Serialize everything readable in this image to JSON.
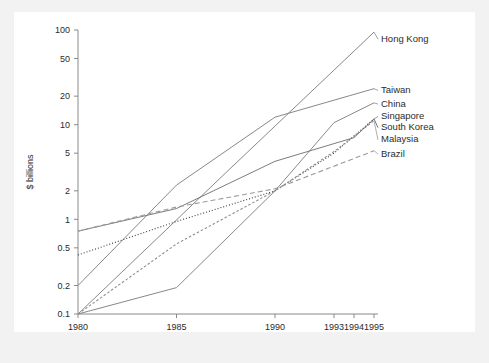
{
  "chart_data": {
    "type": "line",
    "title": "",
    "xlabel": "",
    "ylabel": "$ billions",
    "yscale": "log",
    "ylim": [
      0.1,
      100
    ],
    "grid": false,
    "legend_position": "right-inline-labels",
    "x_ticks": [
      "1980",
      "1985",
      "1990",
      "1993",
      "1994",
      "1995"
    ],
    "x_tick_values": [
      1980,
      1985,
      1990,
      1993,
      1994,
      1995
    ],
    "y_ticks": [
      "0.1",
      "0.2",
      "0.5",
      "1",
      "2",
      "5",
      "10",
      "20",
      "50",
      "100"
    ],
    "y_tick_values": [
      0.1,
      0.2,
      0.5,
      1,
      2,
      5,
      10,
      20,
      50,
      100
    ],
    "x": [
      1980,
      1985,
      1990,
      1993,
      1994,
      1995
    ],
    "series": [
      {
        "name": "Hong Kong",
        "style": "solid",
        "color": "#7b7b7b",
        "x": [
          1980,
          1987.5,
          1995
        ],
        "values": [
          0.1,
          3.1,
          95
        ]
      },
      {
        "name": "Taiwan",
        "style": "solid",
        "color": "#7b7b7b",
        "x": [
          1980,
          1985,
          1990,
          1995
        ],
        "values": [
          0.2,
          2.3,
          12,
          24
        ]
      },
      {
        "name": "China",
        "style": "solid",
        "color": "#7b7b7b",
        "x": [
          1980,
          1985,
          1990,
          1993,
          1995
        ],
        "values": [
          0.1,
          0.19,
          2.0,
          10.5,
          17
        ]
      },
      {
        "name": "Singapore",
        "style": "solid",
        "color": "#6d6d6d",
        "x": [
          1980,
          1985,
          1990,
          1994,
          1995
        ],
        "values": [
          0.75,
          1.3,
          4.1,
          7.3,
          11.5
        ]
      },
      {
        "name": "South Korea",
        "style": "dotted",
        "color": "#3a3a3a",
        "x": [
          1980,
          1985,
          1990,
          1993,
          1995
        ],
        "values": [
          0.42,
          0.95,
          2.0,
          5.0,
          11.5
        ]
      },
      {
        "name": "Malaysia",
        "style": "dashed-dotted",
        "color": "#8e8e8e",
        "x": [
          1980,
          1985,
          1990,
          1993,
          1995
        ],
        "values": [
          0.1,
          0.55,
          2.0,
          5.2,
          11.0
        ]
      },
      {
        "name": "Brazil",
        "style": "dashed",
        "color": "#9a9a9a",
        "x": [
          1980,
          1985,
          1990,
          1995
        ],
        "values": [
          0.75,
          1.35,
          2.1,
          5.3
        ]
      }
    ],
    "series_labels": [
      {
        "name": "Hong Kong",
        "label_y_value": 80
      },
      {
        "name": "Taiwan",
        "label_y_value": 23
      },
      {
        "name": "China",
        "label_y_value": 16.5
      },
      {
        "name": "Singapore",
        "label_y_value": 12.2
      },
      {
        "name": "South Korea",
        "label_y_value": 9.3
      },
      {
        "name": "Malaysia",
        "label_y_value": 6.9
      },
      {
        "name": "Brazil",
        "label_y_value": 4.9
      }
    ]
  },
  "colors": {
    "background": "#ffffff",
    "mat": "#f2f2f2",
    "axis": "#8a8a8a",
    "text": "#2b2b2b"
  }
}
